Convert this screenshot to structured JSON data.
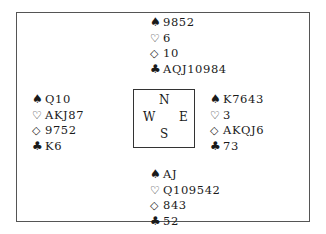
{
  "diagram": {
    "type": "bridge-deal",
    "suit_symbols": {
      "spades": "♠",
      "hearts": "♡",
      "diamonds": "◇",
      "clubs": "♣"
    },
    "compass": {
      "north": "N",
      "south": "S",
      "east": "E",
      "west": "W"
    },
    "hands": {
      "north": {
        "spades": "9852",
        "hearts": "6",
        "diamonds": "10",
        "clubs": "AQJ10984"
      },
      "west": {
        "spades": "Q10",
        "hearts": "AKJ87",
        "diamonds": "9752",
        "clubs": "K6"
      },
      "east": {
        "spades": "K7643",
        "hearts": "3",
        "diamonds": "AKQJ6",
        "clubs": "73"
      },
      "south": {
        "spades": "AJ",
        "hearts": "Q109542",
        "diamonds": "843",
        "clubs": "52"
      }
    }
  }
}
